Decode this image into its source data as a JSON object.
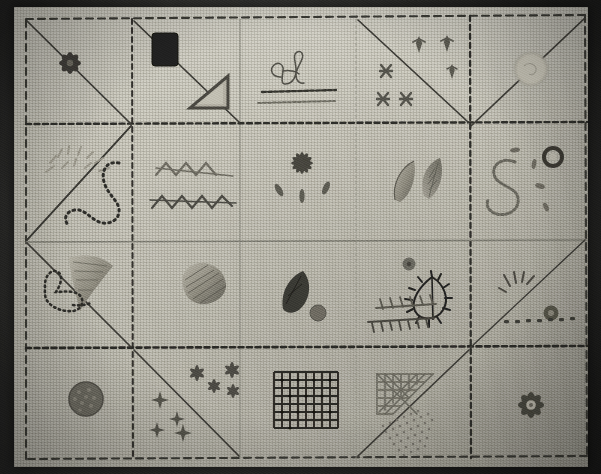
{
  "artifact": {
    "title": "Hand-embroidered stitch sampler",
    "medium": "cotton / linen plain-weave cloth",
    "cloth_color": "#cfcdc2",
    "background_color": "#3f3f3c",
    "thread_dark": "#2b2a27",
    "thread_mid": "#6e6c62",
    "thread_light": "#9a978b"
  },
  "frame": {
    "border_stitch": "running-stitch-dashed",
    "border_label": "dashed running stitch border"
  },
  "grid": {
    "columns": 5,
    "rows": 4,
    "column_x": [
      24,
      132,
      240,
      356,
      470,
      586
    ],
    "row_y": [
      18,
      125,
      242,
      348,
      456
    ],
    "line_styles": [
      "dashed-running",
      "thin-outline",
      "dark-chain"
    ]
  },
  "cells": [
    {
      "row": 1,
      "col": 1,
      "motif": "eight-petal-rosette",
      "label": "Dark satin-stitch rosette / star flower",
      "diagonal": "none"
    },
    {
      "row": 1,
      "col": 2,
      "motif": "filled-square-block",
      "label": "Solid dark satin-stitch square block",
      "diagonal": "none"
    },
    {
      "row": 1,
      "col": 2.5,
      "motif": "outlined-triangle",
      "label": "Outlined triangle with shaded fill",
      "diagonal": "down-right"
    },
    {
      "row": 1,
      "col": 3,
      "motif": "script-letter-B",
      "label": "Cursive script letter B with two stitched rules",
      "diagonal": "none"
    },
    {
      "row": 1,
      "col": 4,
      "motif": "cross-stitch-marks",
      "label": "Three cross-stitch X marks",
      "diagonal": "down-right"
    },
    {
      "row": 1,
      "col": 4.5,
      "motif": "arrow-sprigs",
      "label": "Three small arrow / fleur sprigs",
      "diagonal": "none"
    },
    {
      "row": 1,
      "col": 5,
      "motif": "pale-circle-disc",
      "label": "Faint outlined circle disc",
      "diagonal": "none"
    },
    {
      "row": 2,
      "col": 1,
      "motif": "sun-rays",
      "label": "Radiating straight-stitch sun rays",
      "diagonal": "down-right"
    },
    {
      "row": 2,
      "col": 1.5,
      "motif": "beaded-curve",
      "label": "Beaded / knotted meandering curve",
      "diagonal": "none"
    },
    {
      "row": 2,
      "col": 2,
      "motif": "herringbone-rows",
      "label": "Two rows of herringbone cross stitch",
      "diagonal": "none"
    },
    {
      "row": 2,
      "col": 3,
      "motif": "star-with-leaves",
      "label": "Six-point star with three detached chain leaves",
      "diagonal": "none"
    },
    {
      "row": 2,
      "col": 4,
      "motif": "two-leaves",
      "label": "Pair of satin-stitch leaves",
      "diagonal": "none"
    },
    {
      "row": 2,
      "col": 5,
      "motif": "letter-S-chain",
      "label": "Chain-stitch letter S with eyelet ring and seed dashes",
      "diagonal": "down-left"
    },
    {
      "row": 3,
      "col": 1,
      "motif": "shaded-leaf",
      "label": "Long shaded satin-stitch leaf",
      "diagonal": "down-right"
    },
    {
      "row": 3,
      "col": 1.5,
      "motif": "dotted-bird-outline",
      "label": "Dotted running-stitch bird / leaf outline",
      "diagonal": "none"
    },
    {
      "row": 3,
      "col": 2,
      "motif": "fan-shell",
      "label": "Fan-shaped shaded shell petal",
      "diagonal": "none"
    },
    {
      "row": 3,
      "col": 3,
      "motif": "dark-leaf-and-dot",
      "label": "Dark filled leaf with round dot",
      "diagonal": "none"
    },
    {
      "row": 3,
      "col": 4,
      "motif": "blanket-stitch-leaf",
      "label": "Blanket-stitch outlined leaf, dot and two feather-stitch rows",
      "diagonal": "none"
    },
    {
      "row": 3,
      "col": 5,
      "motif": "ray-burst-and-dashes",
      "label": "Small ray burst, round knot and row of seed dashes",
      "diagonal": "down-right"
    },
    {
      "row": 4,
      "col": 1,
      "motif": "french-knot-disc",
      "label": "Dense French-knot filled disc",
      "diagonal": "none"
    },
    {
      "row": 4,
      "col": 2,
      "motif": "star-and-cross-sprays",
      "label": "Scattered stars and four-point crosses",
      "diagonal": "down-right"
    },
    {
      "row": 4,
      "col": 3,
      "motif": "lattice-grid-square",
      "label": "Dark couched lattice grid square",
      "diagonal": "none"
    },
    {
      "row": 4,
      "col": 4,
      "motif": "diaper-triangle-and-seeds",
      "label": "Cross-hatch diaper triangle with seed-stitch triangle",
      "diagonal": "up-right"
    },
    {
      "row": 4,
      "col": 5,
      "motif": "eight-petal-flower",
      "label": "Eight-petal satin-stitch flower",
      "diagonal": "none"
    }
  ]
}
